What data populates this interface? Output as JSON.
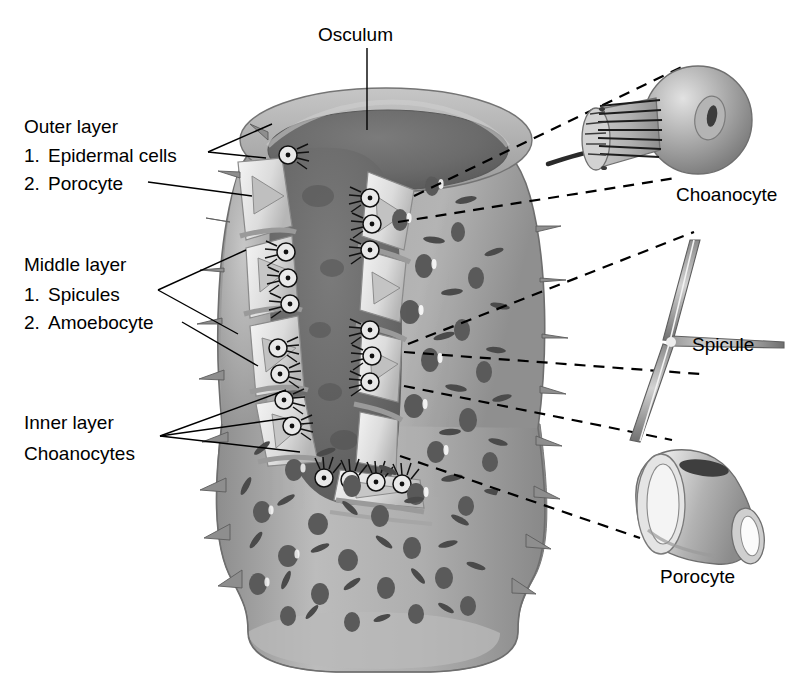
{
  "figure": {
    "background": "#ffffff",
    "ink": "#000000"
  },
  "labels": {
    "osculum": "Osculum",
    "outer_layer_heading": "Outer layer",
    "outer_item_1_num": "1.",
    "outer_item_1": "Epidermal cells",
    "outer_item_2_num": "2.",
    "outer_item_2": "Porocyte",
    "middle_layer_heading": "Middle layer",
    "middle_item_1_num": "1.",
    "middle_item_1": "Spicules",
    "middle_item_2_num": "2.",
    "middle_item_2": "Amoebocyte",
    "inner_layer_heading": "Inner layer",
    "inner_item_1": "Choanocytes",
    "callout_choanocyte": "Choanocyte",
    "callout_spicule": "Spicule",
    "callout_porocyte": "Porocyte"
  },
  "colors": {
    "body_outer_light": "#c2c2c2",
    "body_outer_mid": "#9e9e9e",
    "body_outer_dark": "#8a8a8a",
    "spongocoel_dark": "#6b6b6b",
    "spongocoel_darker": "#5e5e5e",
    "ostia": "#5a5a5a",
    "spicule_mark": "#4a4a4a",
    "mesohyl_pale": "#efefef",
    "mesohyl_shade": "#bdbdbd",
    "cell_outline": "#111111",
    "detail_light": "#d8d8d8",
    "detail_mid": "#a6a6a6",
    "detail_dark": "#7a7a7a",
    "nucleus": "#3c3c3c",
    "white": "#ffffff"
  },
  "structures": {
    "sponge_body": "vase-shaped sponge with cutaway revealing spongocoel",
    "osculum_rim": "elliptical opening at top of sponge",
    "spongocoel": "dark central cavity",
    "choanocyte_rows": "collared flagellated cells lining inner cavity wall",
    "ostia_count_approx": 26,
    "surface_spicule_marks_approx": 34,
    "protruding_spines_approx": 18
  },
  "detail_panels": [
    {
      "name": "choanocyte",
      "label": "Choanocyte",
      "parts": [
        "cell body sphere",
        "nucleus",
        "collar",
        "flagellum"
      ]
    },
    {
      "name": "spicule",
      "label": "Spicule",
      "parts": [
        "three-rayed triaxon",
        "upper ray",
        "right ray",
        "lower-left ray"
      ]
    },
    {
      "name": "porocyte",
      "label": "Porocyte",
      "parts": [
        "tubular cell",
        "wide aperture",
        "narrow aperture",
        "nucleus"
      ]
    }
  ]
}
